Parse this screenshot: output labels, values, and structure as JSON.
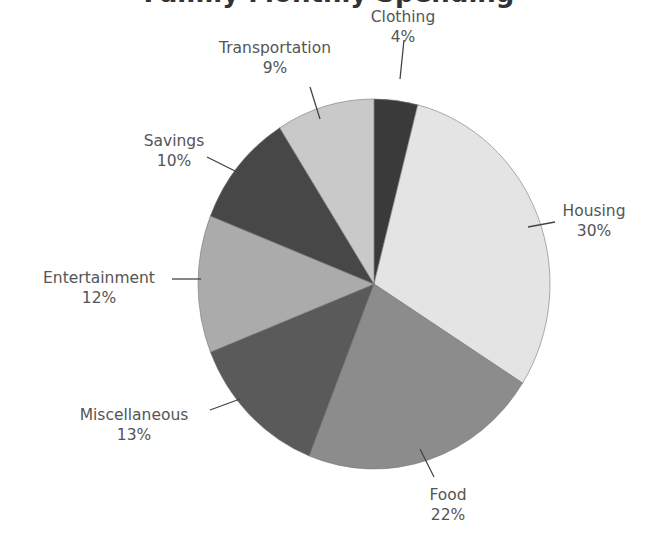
{
  "title": "Family Monthly Spending",
  "chart_data": {
    "type": "pie",
    "title": "Family Monthly Spending",
    "start_angle": "12 o'clock",
    "direction": "clockwise",
    "categories": [
      "Clothing",
      "Housing",
      "Food",
      "Miscellaneous",
      "Entertainment",
      "Savings",
      "Transportation"
    ],
    "values": [
      4,
      30,
      22,
      13,
      12,
      10,
      9
    ],
    "labels": [
      "4%",
      "30%",
      "22%",
      "13%",
      "12%",
      "10%",
      "9%"
    ],
    "colors": [
      "#3a3a3a",
      "#e4e4e4",
      "#8c8c8c",
      "#5a5a5a",
      "#ababab",
      "#474747",
      "#c9c9c9"
    ],
    "legend": "none",
    "label_position": "outside with leader lines"
  },
  "slices": [
    {
      "name": "Clothing",
      "pct": "4%"
    },
    {
      "name": "Housing",
      "pct": "30%"
    },
    {
      "name": "Food",
      "pct": "22%"
    },
    {
      "name": "Miscellaneous",
      "pct": "13%"
    },
    {
      "name": "Entertainment",
      "pct": "12%"
    },
    {
      "name": "Savings",
      "pct": "10%"
    },
    {
      "name": "Transportation",
      "pct": "9%"
    }
  ]
}
